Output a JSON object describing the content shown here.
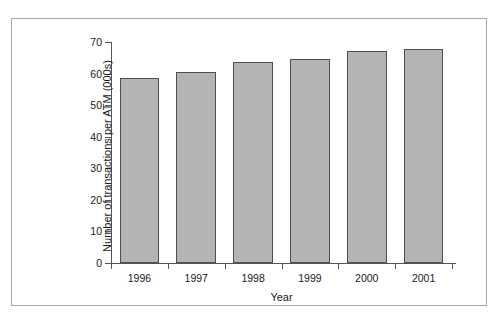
{
  "figure": {
    "frame_color": "#a9a9a9",
    "background": "#ffffff"
  },
  "chart_data": {
    "type": "bar",
    "title": "",
    "xlabel": "Year",
    "ylabel": "Number of transactions per ATM (000s)",
    "categories": [
      "1996",
      "1997",
      "1998",
      "1999",
      "2000",
      "2001"
    ],
    "values": [
      58.7,
      60.6,
      63.6,
      64.7,
      67.2,
      67.8
    ],
    "ylim": [
      0,
      70
    ],
    "yticks": [
      0,
      10,
      20,
      30,
      40,
      50,
      60,
      70
    ],
    "ytick_labels": [
      "0",
      "10",
      "20",
      "30",
      "40",
      "50",
      "60",
      "70"
    ],
    "grid": false,
    "legend": null,
    "bar_fill_color": "#b4b4b4",
    "bar_edge_color": "#4d4d4d"
  }
}
